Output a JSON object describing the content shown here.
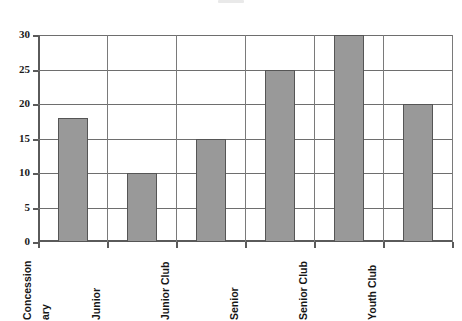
{
  "chart_data": {
    "type": "bar",
    "title": "",
    "xlabel": "",
    "ylabel": "",
    "categories": [
      "Concession\nary",
      "Junior",
      "Junior Club",
      "Senior",
      "Senior Club",
      "Youth Club"
    ],
    "category_full_names": [
      "Concessionary",
      "Junior",
      "Junior Club",
      "Senior",
      "Senior Club",
      "Youth Club"
    ],
    "values": [
      18,
      10,
      15,
      25,
      30,
      20
    ],
    "ylim": [
      0,
      30
    ],
    "yticks": [
      0,
      5,
      10,
      15,
      20,
      25,
      30
    ],
    "ytick_labels": [
      "0",
      "5",
      "10",
      "15",
      "20",
      "25",
      "30"
    ],
    "grid": "horizontal-and-category-separators",
    "legend": "none",
    "bar_color": "#999999",
    "bar_border_color": "#555555",
    "axis_color": "#5a5a5a",
    "gridline_color": "#6e6e6e",
    "background_color": "#ffffff",
    "xtick_label_rotation": 90
  }
}
